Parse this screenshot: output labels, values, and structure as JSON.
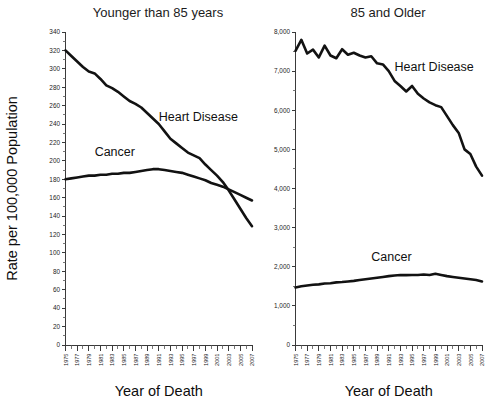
{
  "figure": {
    "width": 497,
    "height": 403,
    "background": "#ffffff",
    "line_color": "#121212",
    "axis_color": "#3a3a3a",
    "text_color": "#1a1a1a"
  },
  "panels": [
    {
      "id": "younger-than-85",
      "title": "Younger than 85 years",
      "xlabel": "Year of Death",
      "ylabel": "Rate per 100,000 Population"
    },
    {
      "id": "85-and-older",
      "title": "85 and Older",
      "xlabel": "Year of Death",
      "ylabel": ""
    }
  ],
  "series_labels": {
    "heart_disease": "Heart Disease",
    "cancer": "Cancer"
  },
  "chart_data": [
    {
      "type": "line",
      "title": "Younger than 85 years",
      "xlabel": "Year of Death",
      "ylabel": "Rate per 100,000 Population",
      "xlim": [
        1975,
        2007
      ],
      "ylim": [
        0,
        340
      ],
      "ytick_step": 20,
      "ytick_minor_step": 10,
      "grid": false,
      "legend": "inline-annotations",
      "x": [
        1975,
        1976,
        1977,
        1978,
        1979,
        1980,
        1981,
        1982,
        1983,
        1984,
        1985,
        1986,
        1987,
        1988,
        1989,
        1990,
        1991,
        1992,
        1993,
        1994,
        1995,
        1996,
        1997,
        1998,
        1999,
        2000,
        2001,
        2002,
        2003,
        2004,
        2005,
        2006,
        2007
      ],
      "xtick_labels": [
        "1975",
        "1977",
        "1979",
        "1981",
        "1983",
        "1985",
        "1987",
        "1989",
        "1991",
        "1993",
        "1995",
        "1997",
        "1999",
        "2001",
        "2003",
        "2005",
        "2007"
      ],
      "ytick_labels": [
        "0",
        "20",
        "40",
        "60",
        "80",
        "100",
        "120",
        "140",
        "160",
        "180",
        "200",
        "220",
        "240",
        "260",
        "280",
        "300",
        "320",
        "340"
      ],
      "series": [
        {
          "name": "Heart Disease",
          "label_x": 1991,
          "label_y": 243,
          "values": [
            320,
            314,
            308,
            302,
            297,
            295,
            289,
            282,
            279,
            275,
            270,
            265,
            262,
            258,
            252,
            246,
            240,
            232,
            224,
            219,
            214,
            209,
            206,
            203,
            196,
            190,
            184,
            177,
            168,
            158,
            148,
            138,
            129
          ]
        },
        {
          "name": "Cancer",
          "label_x": 1980,
          "label_y": 205,
          "values": [
            180,
            181,
            182,
            183,
            184,
            184,
            185,
            185,
            186,
            186,
            187,
            187,
            188,
            189,
            190,
            191,
            191,
            190,
            189,
            188,
            187,
            185,
            183,
            181,
            179,
            176,
            174,
            172,
            169,
            166,
            163,
            160,
            157
          ]
        }
      ]
    },
    {
      "type": "line",
      "title": "85 and Older",
      "xlabel": "Year of Death",
      "ylabel": "",
      "xlim": [
        1975,
        2007
      ],
      "ylim": [
        0,
        8000
      ],
      "ytick_step": 1000,
      "ytick_minor_step": 500,
      "grid": false,
      "legend": "inline-annotations",
      "x": [
        1975,
        1976,
        1977,
        1978,
        1979,
        1980,
        1981,
        1982,
        1983,
        1984,
        1985,
        1986,
        1987,
        1988,
        1989,
        1990,
        1991,
        1992,
        1993,
        1994,
        1995,
        1996,
        1997,
        1998,
        1999,
        2000,
        2001,
        2002,
        2003,
        2004,
        2005,
        2006,
        2007
      ],
      "xtick_labels": [
        "1975",
        "1977",
        "1979",
        "1981",
        "1983",
        "1985",
        "1987",
        "1989",
        "1991",
        "1993",
        "1995",
        "1997",
        "1999",
        "2001",
        "2003",
        "2005",
        "2007"
      ],
      "ytick_labels": [
        "0",
        "1,000",
        "2,000",
        "3,000",
        "4,000",
        "5,000",
        "6,000",
        "7,000",
        "8,000"
      ],
      "series": [
        {
          "name": "Heart Disease",
          "label_x": 1992,
          "label_y": 7000,
          "values": [
            7520,
            7800,
            7450,
            7550,
            7350,
            7650,
            7400,
            7330,
            7560,
            7420,
            7470,
            7400,
            7350,
            7380,
            7200,
            7170,
            7000,
            6750,
            6620,
            6480,
            6620,
            6420,
            6300,
            6200,
            6130,
            6080,
            5850,
            5620,
            5420,
            5000,
            4880,
            4560,
            4330
          ]
        },
        {
          "name": "Cancer",
          "label_x": 1988,
          "label_y": 2150,
          "values": [
            1470,
            1500,
            1520,
            1540,
            1550,
            1570,
            1580,
            1600,
            1610,
            1625,
            1640,
            1660,
            1680,
            1700,
            1720,
            1740,
            1760,
            1775,
            1790,
            1785,
            1790,
            1790,
            1800,
            1790,
            1820,
            1790,
            1760,
            1740,
            1720,
            1700,
            1680,
            1660,
            1625
          ]
        }
      ]
    }
  ]
}
